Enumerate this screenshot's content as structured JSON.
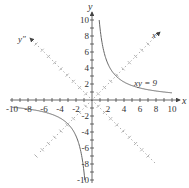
{
  "diagram": {
    "title": "",
    "axes": {
      "x_label": "x",
      "y_label": "y",
      "x_prime_label": "x″",
      "y_prime_label": "y″",
      "x_ticks": [
        "-10",
        "-8",
        "-6",
        "-4",
        "-2",
        "2",
        "4",
        "6",
        "8",
        "10"
      ],
      "y_ticks": [
        "10",
        "8",
        "6",
        "4",
        "2",
        "-2",
        "-4",
        "-6",
        "-8",
        "-10"
      ],
      "range": [
        -10,
        10
      ]
    },
    "curve": {
      "equation_label": "xy = 9",
      "equation": "xy = 9",
      "branches": [
        "quadrant I",
        "quadrant III"
      ]
    },
    "colors": {
      "axis": "#444444",
      "curve": "#666666",
      "rotated_axis": "#888888",
      "text": "#333333"
    }
  }
}
